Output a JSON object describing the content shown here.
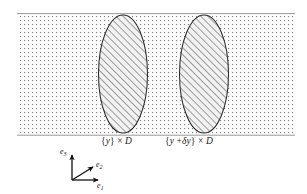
{
  "figure": {
    "title": "",
    "canvas": {
      "width": 307,
      "height": 194,
      "background": "#ffffff"
    },
    "band": {
      "name": "stippled-slab",
      "x": 17,
      "y": 14,
      "width": 278,
      "height": 121,
      "fill_pattern": "fine-dotted-grid",
      "dot_color": "#8d8d8d",
      "border_color": "#9a9a9a",
      "background": "#fdfdfd"
    },
    "ellipses": [
      {
        "id": "cross-section-y",
        "cx": 123,
        "cy": 74,
        "rx": 24.5,
        "ry": 59,
        "fill": "#efefef",
        "stroke": "#2b2b2b",
        "hatch": "diagonal-45-up",
        "hatch_color": "#5a5a5a"
      },
      {
        "id": "cross-section-y-plus-dy",
        "cx": 204,
        "cy": 74,
        "rx": 24.5,
        "ry": 59,
        "fill": "#efefef",
        "stroke": "#2b2b2b",
        "hatch": "diagonal-45-up",
        "hatch_color": "#5a5a5a"
      }
    ],
    "labels": {
      "left_section": {
        "text_full": "{y} × D",
        "open_brace": "{",
        "variable": "y",
        "close_brace": "}",
        "times": "×",
        "domain": "D",
        "x": 102,
        "y": 137
      },
      "right_section": {
        "text_full": "{y + δy} × D",
        "open_brace": "{",
        "variable": "y",
        "plus": "+",
        "delta": "δ",
        "variable2": "y",
        "close_brace": "}",
        "times": "×",
        "domain": "D",
        "x": 166,
        "y": 137
      }
    },
    "axes": {
      "name": "coordinate-triad",
      "origin": {
        "x": 72,
        "y": 180
      },
      "stroke": "#111111",
      "vectors": [
        {
          "id": "e3",
          "label_base": "e",
          "label_sub": "3",
          "dx": 0,
          "dy": -27,
          "label_x": 60,
          "label_y": 148
        },
        {
          "id": "e2",
          "label_base": "e",
          "label_sub": "2",
          "dx": 23,
          "dy": -14,
          "label_x": 99,
          "label_y": 160
        },
        {
          "id": "e1",
          "label_base": "e",
          "label_sub": "1",
          "dx": 28,
          "dy": 0,
          "label_x": 99,
          "label_y": 180
        }
      ]
    }
  }
}
